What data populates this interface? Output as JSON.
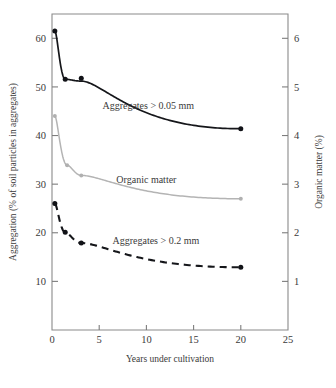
{
  "chart_data": {
    "type": "line",
    "title": "",
    "xlabel": "Years under cultivation",
    "ylabel": "Aggregation (% of soil particles in aggregates)",
    "y2label": "Organic matter (%)",
    "xlim": [
      0,
      25
    ],
    "ylim": [
      0,
      65
    ],
    "y2lim": [
      0,
      6.5
    ],
    "xticks": [
      "0",
      "5",
      "10",
      "15",
      "20",
      "25"
    ],
    "xtick_values": [
      0,
      5,
      10,
      15,
      20,
      25
    ],
    "yticks": [
      "10",
      "20",
      "30",
      "40",
      "50",
      "60"
    ],
    "ytick_values": [
      10,
      20,
      30,
      40,
      50,
      60
    ],
    "y2ticks": [
      "1",
      "2",
      "3",
      "4",
      "5",
      "6"
    ],
    "y2tick_values": [
      1,
      2,
      3,
      4,
      5,
      6
    ],
    "grid": false,
    "legend_position": "inline-annotations",
    "series": [
      {
        "name": "Aggregates > 0.05 mm",
        "style": "solid",
        "color": "#15161a",
        "axis": "left",
        "label_text": "Aggregates > 0.05 mm",
        "x": [
          0.3,
          1.4,
          3.1,
          20.0
        ],
        "values": [
          61.5,
          51.6,
          51.8,
          41.4
        ]
      },
      {
        "name": "Organic matter",
        "style": "solid",
        "color": "#b4b4b4",
        "axis": "right",
        "label_text": "Organic matter",
        "x": [
          0.3,
          1.6,
          3.1,
          20.0
        ],
        "values": [
          44.0,
          33.9,
          31.8,
          27.0
        ],
        "values_right_axis": [
          4.4,
          3.39,
          3.18,
          2.7
        ]
      },
      {
        "name": "Aggregates > 0.2 mm",
        "style": "dashed",
        "color": "#15161a",
        "axis": "left",
        "label_text": "Aggregates > 0.2 mm",
        "x": [
          0.3,
          1.4,
          3.1,
          20.0
        ],
        "values": [
          26.0,
          20.1,
          17.9,
          12.9
        ]
      }
    ],
    "annotations": [
      {
        "text": "Aggregates > 0.05 mm",
        "x": 10.2,
        "y": 45.5
      },
      {
        "text": "Organic matter",
        "x": 10.0,
        "y": 30.3
      },
      {
        "text": "Aggregates > 0.2 mm",
        "x": 11.0,
        "y": 17.6
      }
    ]
  },
  "axes": {
    "x_title": "Years under cultivation",
    "y_left_title": "Aggregation (% of soil particles in aggregates)",
    "y_right_title": "Organic matter (%)"
  }
}
